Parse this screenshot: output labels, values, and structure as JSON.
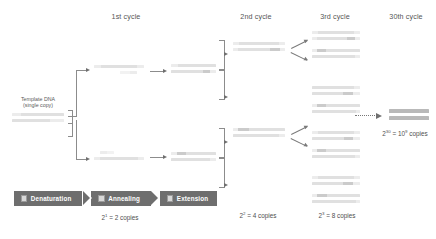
{
  "diagram": {
    "columns": [
      {
        "id": "cycle-1",
        "label": "1st cycle"
      },
      {
        "id": "cycle-2",
        "label": "2nd cycle"
      },
      {
        "id": "cycle-3",
        "label": "3rd cycle"
      },
      {
        "id": "cycle-30",
        "label": "30th cycle"
      }
    ],
    "template": {
      "line1": "Template DNA",
      "line2": "(single copy)"
    },
    "copy_counts": [
      {
        "id": "copies-cycle-1",
        "base": "2",
        "exponent": "1",
        "text": " = 2 copies"
      },
      {
        "id": "copies-cycle-2",
        "base": "2",
        "exponent": "2",
        "text": " = 4 copies"
      },
      {
        "id": "copies-cycle-3",
        "base": "2",
        "exponent": "3",
        "text": " = 8 copies"
      },
      {
        "id": "copies-cycle-30",
        "base": "2",
        "exponent": "30",
        "text": " = 10",
        "text2": " copies",
        "exponent2": "9"
      }
    ],
    "process_steps": [
      {
        "id": "denaturation",
        "label": "Denaturation",
        "icon": "square-icon"
      },
      {
        "id": "annealing",
        "label": "Annealing",
        "icon": "square-icon"
      },
      {
        "id": "extension",
        "label": "Extension",
        "icon": "square-icon"
      }
    ],
    "colors": {
      "process_bar": "#6e6e6e",
      "strand_dark": "#b9b9b9",
      "strand_mid": "#cbcbcb",
      "strand_light": "#e0e0e0",
      "strand_pale": "#ececec",
      "connector": "#8c8c8c",
      "text": "#4a4a4a"
    }
  }
}
